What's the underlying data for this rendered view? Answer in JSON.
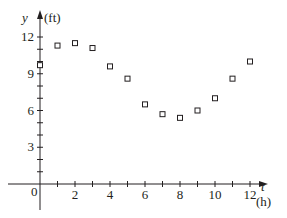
{
  "chart_data": {
    "type": "scatter",
    "title": "",
    "xlabel": "t",
    "xunit": "(h)",
    "ylabel": "y",
    "yunit": "(ft)",
    "x": [
      0,
      1,
      2,
      3,
      4,
      5,
      6,
      7,
      8,
      9,
      10,
      11,
      12
    ],
    "series": [
      {
        "name": "water depth",
        "marker": "open-square",
        "values": [
          9.7,
          11.3,
          11.5,
          11.1,
          9.6,
          8.6,
          6.5,
          5.7,
          5.4,
          6.0,
          7.0,
          8.6,
          10.0
        ]
      }
    ],
    "xlim": [
      -1,
      13
    ],
    "ylim": [
      -2,
      13
    ],
    "xticks_labeled": [
      "0",
      "2",
      "4",
      "6",
      "8",
      "10",
      "12"
    ],
    "yticks_labeled": [
      "3",
      "6",
      "9",
      "12"
    ],
    "grid": false,
    "legend": false
  },
  "labels": {
    "y_axis": "y",
    "y_unit": "(ft)",
    "x_axis": "t",
    "x_unit": "(h)",
    "origin": "0"
  }
}
